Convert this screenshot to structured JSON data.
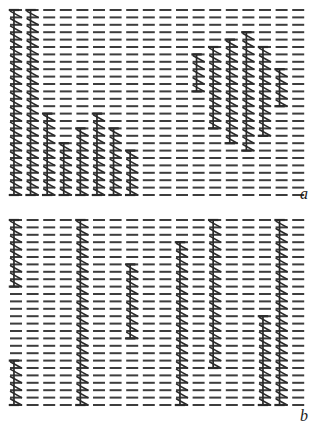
{
  "figure": {
    "type": "dash-raster-with-errorbars",
    "background_color": "#ffffff",
    "ink_color": "#2a2a2a",
    "dash_color": "#3d3d3d",
    "width": 321,
    "height": 429,
    "panels": [
      {
        "id": "panel-a",
        "label": "a",
        "label_x": 300,
        "label_y": 186,
        "x": 10,
        "y": 10,
        "width": 305,
        "height": 196,
        "columns": 18,
        "rows": 26,
        "col_pitch": 16.6,
        "row_pitch": 7.4,
        "dash_length": 12,
        "dash_thickness": 2,
        "overlays": [
          {
            "col": 0,
            "row_start": 0,
            "row_end": 25
          },
          {
            "col": 1,
            "row_start": 0,
            "row_end": 25
          },
          {
            "col": 2,
            "row_start": 14,
            "row_end": 25
          },
          {
            "col": 3,
            "row_start": 18,
            "row_end": 25
          },
          {
            "col": 4,
            "row_start": 16,
            "row_end": 25
          },
          {
            "col": 5,
            "row_start": 14,
            "row_end": 25
          },
          {
            "col": 6,
            "row_start": 16,
            "row_end": 25
          },
          {
            "col": 7,
            "row_start": 19,
            "row_end": 25
          },
          {
            "col": 11,
            "row_start": 6,
            "row_end": 11
          },
          {
            "col": 12,
            "row_start": 5,
            "row_end": 16
          },
          {
            "col": 13,
            "row_start": 4,
            "row_end": 18
          },
          {
            "col": 14,
            "row_start": 3,
            "row_end": 19
          },
          {
            "col": 15,
            "row_start": 5,
            "row_end": 17
          },
          {
            "col": 16,
            "row_start": 8,
            "row_end": 13
          }
        ]
      },
      {
        "id": "panel-b",
        "label": "b",
        "label_x": 300,
        "label_y": 408,
        "x": 10,
        "y": 220,
        "width": 305,
        "height": 196,
        "columns": 18,
        "rows": 26,
        "col_pitch": 16.6,
        "row_pitch": 7.4,
        "dash_length": 12,
        "dash_thickness": 2,
        "overlays": [
          {
            "col": 0,
            "row_start": 0,
            "row_end": 9
          },
          {
            "col": 0,
            "row_start": 19,
            "row_end": 25
          },
          {
            "col": 4,
            "row_start": 0,
            "row_end": 25
          },
          {
            "col": 7,
            "row_start": 6,
            "row_end": 16
          },
          {
            "col": 10,
            "row_start": 3,
            "row_end": 25
          },
          {
            "col": 12,
            "row_start": 0,
            "row_end": 20
          },
          {
            "col": 15,
            "row_start": 13,
            "row_end": 25
          },
          {
            "col": 16,
            "row_start": 0,
            "row_end": 25
          }
        ]
      }
    ]
  }
}
